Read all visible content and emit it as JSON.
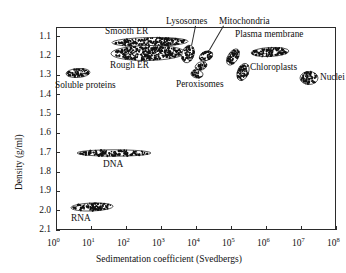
{
  "chart_data": {
    "type": "scatter",
    "title": "",
    "xlabel": "Sedimentation coefficient (Svedbergs)",
    "ylabel": "Density (g/ml)",
    "xscale": "log",
    "yscale": "linear",
    "y_inverted": true,
    "xlim": [
      1,
      100000000
    ],
    "ylim": [
      1.05,
      2.1
    ],
    "grid": false,
    "legend": "none",
    "x_tick_labels": [
      "10^0",
      "10^1",
      "10^2",
      "10^3",
      "10^4",
      "10^5",
      "10^6",
      "10^7",
      "10^8"
    ],
    "x_tick_bases": [
      "10",
      "10",
      "10",
      "10",
      "10",
      "10",
      "10",
      "10",
      "10"
    ],
    "x_tick_exponents": [
      "0",
      "1",
      "2",
      "3",
      "4",
      "5",
      "6",
      "7",
      "8"
    ],
    "x_tick_values": [
      1,
      10,
      100,
      1000,
      10000,
      100000,
      1000000,
      10000000,
      100000000
    ],
    "y_tick_labels": [
      "1.1",
      "1.2",
      "1.3",
      "1.4",
      "1.5",
      "1.6",
      "1.7",
      "1.8",
      "1.9",
      "2.0",
      "2.1"
    ],
    "y_tick_values": [
      1.1,
      1.2,
      1.3,
      1.4,
      1.5,
      1.6,
      1.7,
      1.8,
      1.9,
      2.0,
      2.1
    ],
    "point_color": "#111111",
    "series": [
      {
        "name": "Soluble proteins",
        "label": "Soluble proteins",
        "s_range": [
          2.0,
          9.0
        ],
        "density_range": [
          1.28,
          1.32
        ],
        "density_center": 1.3,
        "s_center": 4.0,
        "label_position": "below"
      },
      {
        "name": "Smooth ER",
        "label": "Smooth ER",
        "s_range": [
          60,
          9000
        ],
        "density_range": [
          1.13,
          1.17
        ],
        "density_center": 1.15,
        "s_center": 700,
        "label_position": "above"
      },
      {
        "name": "Rough ER",
        "label": "Rough ER",
        "s_range": [
          70,
          7000
        ],
        "density_range": [
          1.17,
          1.23
        ],
        "density_center": 1.2,
        "s_center": 700,
        "label_position": "below"
      },
      {
        "name": "Lysosomes",
        "label": "Lysosomes",
        "s_range": [
          8000,
          25000
        ],
        "density_range": [
          1.14,
          1.22
        ],
        "density_center": 1.18,
        "s_center": 15000,
        "label_position": "above-leader"
      },
      {
        "name": "Mitochondria",
        "label": "Mitochondria",
        "s_range": [
          30000,
          90000
        ],
        "density_range": [
          1.15,
          1.21
        ],
        "density_center": 1.18,
        "s_center": 50000,
        "label_position": "above-leader"
      },
      {
        "name": "Peroxisomes",
        "label": "Peroxisomes",
        "s_range": [
          35000,
          70000
        ],
        "density_range": [
          1.23,
          1.27
        ],
        "density_center": 1.25,
        "s_center": 50000,
        "label_position": "below"
      },
      {
        "name": "Chloroplasts",
        "label": "Chloroplasts",
        "s_range": [
          150000,
          1500000
        ],
        "density_range": [
          1.17,
          1.29
        ],
        "density_center": 1.22,
        "s_center": 500000,
        "label_position": "right"
      },
      {
        "name": "Plasma membrane",
        "label": "Plasma membrane",
        "s_range": [
          400000,
          4000000
        ],
        "density_range": [
          1.14,
          1.19
        ],
        "density_center": 1.16,
        "s_center": 1200000,
        "label_position": "above"
      },
      {
        "name": "Nuclei",
        "label": "Nuclei",
        "s_range": [
          3000000,
          12000000
        ],
        "density_range": [
          1.29,
          1.35
        ],
        "density_center": 1.32,
        "s_center": 6000000,
        "label_position": "right"
      },
      {
        "name": "DNA",
        "label": "DNA",
        "s_range": [
          5.0,
          700
        ],
        "density_range": [
          1.68,
          1.71
        ],
        "density_center": 1.69,
        "s_center": 60,
        "label_position": "below"
      },
      {
        "name": "RNA",
        "label": "RNA",
        "s_range": [
          1.8,
          30
        ],
        "density_range": [
          1.97,
          2.01
        ],
        "density_center": 1.99,
        "s_center": 8,
        "label_position": "below"
      }
    ]
  }
}
